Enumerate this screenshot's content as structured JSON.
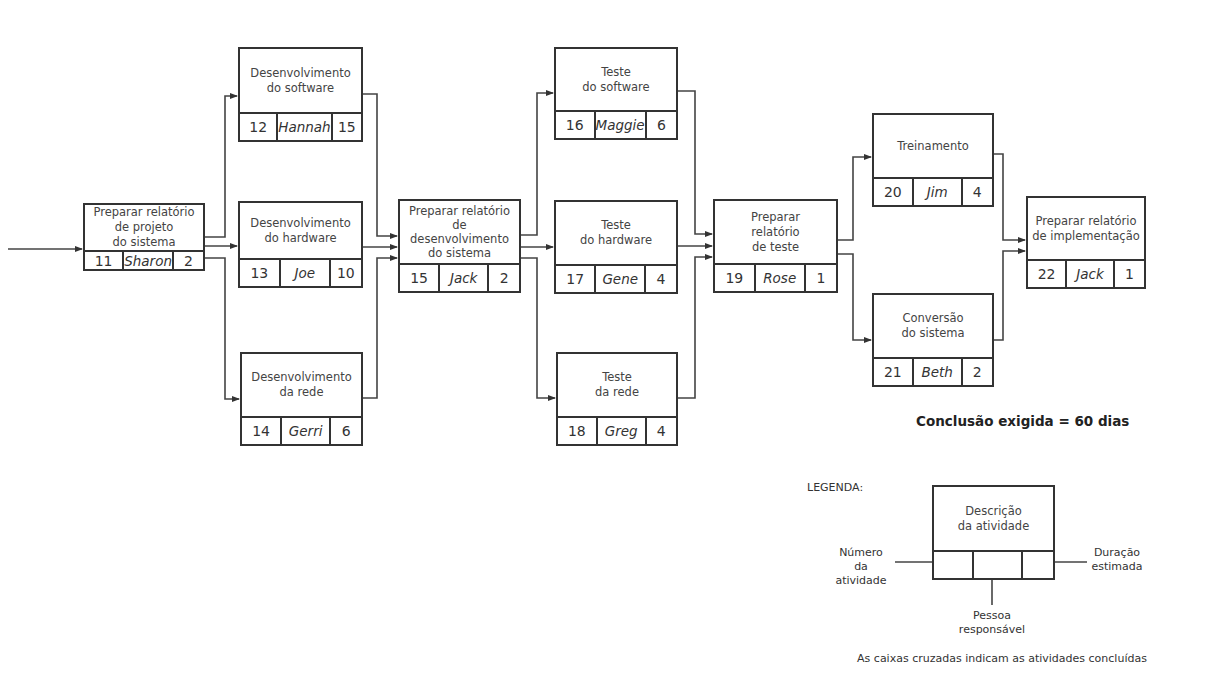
{
  "diagram": {
    "type": "activity-network",
    "nodes": [
      {
        "id": "11",
        "description": "Preparar relatório\nde projeto\ndo sistema",
        "person": "Sharon",
        "duration": "2"
      },
      {
        "id": "12",
        "description": "Desenvolvimento\ndo software",
        "person": "Hannah",
        "duration": "15"
      },
      {
        "id": "13",
        "description": "Desenvolvimento\ndo hardware",
        "person": "Joe",
        "duration": "10"
      },
      {
        "id": "14",
        "description": "Desenvolvimento\nda rede",
        "person": "Gerri",
        "duration": "6"
      },
      {
        "id": "15",
        "description": "Preparar relatório\nde\ndesenvolvimento\ndo sistema",
        "person": "Jack",
        "duration": "2"
      },
      {
        "id": "16",
        "description": "Teste\ndo software",
        "person": "Maggie",
        "duration": "6"
      },
      {
        "id": "17",
        "description": "Teste\ndo hardware",
        "person": "Gene",
        "duration": "4"
      },
      {
        "id": "18",
        "description": "Teste\nda rede",
        "person": "Greg",
        "duration": "4"
      },
      {
        "id": "19",
        "description": "Preparar\nrelatório\nde teste",
        "person": "Rose",
        "duration": "1"
      },
      {
        "id": "20",
        "description": "Treinamento",
        "person": "Jim",
        "duration": "4"
      },
      {
        "id": "21",
        "description": "Conversão\ndo sistema",
        "person": "Beth",
        "duration": "2"
      },
      {
        "id": "22",
        "description": "Preparar relatório\nde implementação",
        "person": "Jack",
        "duration": "1"
      }
    ],
    "edges": [
      [
        "start",
        "11"
      ],
      [
        "11",
        "12"
      ],
      [
        "11",
        "13"
      ],
      [
        "11",
        "14"
      ],
      [
        "12",
        "15"
      ],
      [
        "13",
        "15"
      ],
      [
        "14",
        "15"
      ],
      [
        "15",
        "16"
      ],
      [
        "15",
        "17"
      ],
      [
        "15",
        "18"
      ],
      [
        "16",
        "19"
      ],
      [
        "17",
        "19"
      ],
      [
        "18",
        "19"
      ],
      [
        "19",
        "20"
      ],
      [
        "19",
        "21"
      ],
      [
        "20",
        "22"
      ],
      [
        "21",
        "22"
      ]
    ],
    "completion_note": "Conclusão exigida = 60 dias"
  },
  "legend": {
    "title": "LEGENDA:",
    "box_description": "Descrição\nda atividade",
    "number_label": "Número\nda atividade",
    "duration_label": "Duração\nestimada",
    "person_label": "Pessoa\nresponsável",
    "footnote": "As caixas cruzadas indicam as atividades concluídas"
  },
  "colors": {
    "line": "#333333",
    "text": "#3a3a3a",
    "background": "#ffffff"
  }
}
